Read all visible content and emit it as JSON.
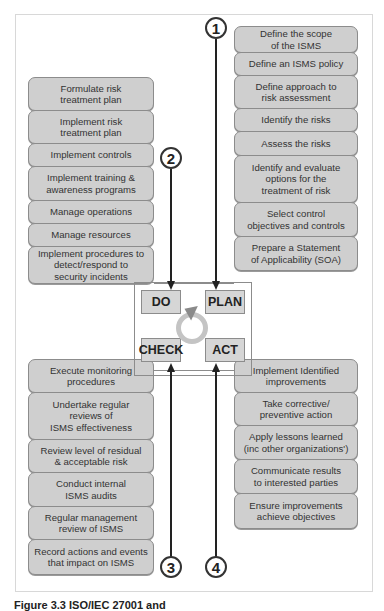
{
  "diagram": {
    "type": "PDCA cycle for ISMS",
    "phases": {
      "do": "DO",
      "plan": "PLAN",
      "check": "CHECK",
      "act": "ACT"
    },
    "step_numbers": [
      "1",
      "2",
      "3",
      "4"
    ],
    "plan_steps": [
      [
        "Define the scope",
        "of the ISMS"
      ],
      [
        "Define an ISMS policy"
      ],
      [
        "Define approach to",
        "risk assessment"
      ],
      [
        "Identify the risks"
      ],
      [
        "Assess the risks"
      ],
      [
        "Identify and evaluate",
        "options for the",
        "treatment of risk"
      ],
      [
        "Select control",
        "objectives and controls"
      ],
      [
        "Prepare a Statement",
        "of Applicability (SOA)"
      ]
    ],
    "do_steps": [
      [
        "Formulate risk",
        "treatment plan"
      ],
      [
        "Implement risk",
        "treatment plan"
      ],
      [
        "Implement controls"
      ],
      [
        "Implement training &",
        "awareness programs"
      ],
      [
        "Manage operations"
      ],
      [
        "Manage resources"
      ],
      [
        "Implement procedures to",
        "detect/respond to",
        "security incidents"
      ]
    ],
    "check_steps": [
      [
        "Execute monitoring",
        "procedures"
      ],
      [
        "Undertake regular",
        "reviews of",
        "ISMS effectiveness"
      ],
      [
        "Review level of residual",
        "& acceptable risk"
      ],
      [
        "Conduct internal",
        "ISMS audits"
      ],
      [
        "Regular management",
        "review of ISMS"
      ],
      [
        "Record actions and events",
        "that impact on ISMS"
      ]
    ],
    "act_steps": [
      [
        "Implement Identified",
        "improvements"
      ],
      [
        "Take corrective/",
        "preventive action"
      ],
      [
        "Apply lessons learned",
        "(inc other organizations')"
      ],
      [
        "Communicate results",
        "to interested parties"
      ],
      [
        "Ensure improvements",
        "achieve objectives"
      ]
    ],
    "caption": "Figure 3.3 ISO/IEC 27001 and"
  },
  "colors": {
    "box_fill": "#cfcfcf",
    "box_border": "#8c8c8c",
    "line": "#222222",
    "cycle": "#c4c4c4"
  }
}
